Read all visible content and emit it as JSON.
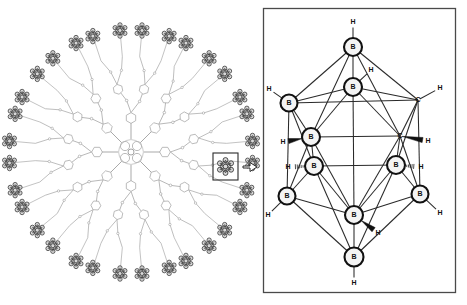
{
  "figure": {
    "background_color": "#ffffff",
    "ink_color": "#1a1a1a",
    "dendrimer_line_color": "#9a9a9a",
    "cluster_fill": "#f2f2f2"
  },
  "left_panel": {
    "name": "dendrimer-diagram",
    "description": "Radial porphyrin-cored dendrimer with peripheral carborane clusters",
    "core_label": "porphyrin-core",
    "branch_generations": 3,
    "peripheral_cluster_count": 32,
    "wedge_count": 8
  },
  "callout": {
    "name": "magnification-callout",
    "box_label": "selected-cluster",
    "arrow_glyph": "⇒"
  },
  "right_panel": {
    "name": "carborane-structure-panel",
    "border_color": "#4a4a4a",
    "molecule": "ortho-carborane C2B10H12",
    "atoms": [
      {
        "id": "a1",
        "element": "B",
        "x": 353,
        "y": 47,
        "r": 9.0,
        "h": {
          "label": "H",
          "x": 353,
          "y": 22,
          "style": "line",
          "angle": "up"
        }
      },
      {
        "id": "a2",
        "element": "B",
        "x": 353,
        "y": 87,
        "r": 9.0,
        "h": {
          "label": "H",
          "x": 371,
          "y": 70,
          "style": "line",
          "angle": "upright"
        }
      },
      {
        "id": "a3",
        "element": "B",
        "x": 289,
        "y": 103,
        "r": 8.5,
        "h": {
          "label": "H",
          "x": 269,
          "y": 89,
          "style": "line",
          "angle": "upleft"
        }
      },
      {
        "id": "a4",
        "element": "C",
        "x": 418,
        "y": 100,
        "r": 0.0,
        "h": {
          "label": "H",
          "x": 440,
          "y": 88,
          "style": "line",
          "angle": "upright"
        }
      },
      {
        "id": "a5",
        "element": "B",
        "x": 311,
        "y": 137,
        "r": 9.0,
        "h": {
          "label": "H",
          "x": 283,
          "y": 142,
          "style": "wedge",
          "angle": "left"
        }
      },
      {
        "id": "a6",
        "element": "C",
        "x": 400,
        "y": 136,
        "r": 0.0,
        "h": {
          "label": "H",
          "x": 428,
          "y": 141,
          "style": "wedge",
          "angle": "right"
        }
      },
      {
        "id": "a7",
        "element": "B",
        "x": 314,
        "y": 166,
        "r": 9.0,
        "h": {
          "label": "H",
          "x": 288,
          "y": 167,
          "style": "hash",
          "angle": "left"
        }
      },
      {
        "id": "a8",
        "element": "B",
        "x": 396,
        "y": 165,
        "r": 9.0,
        "h": {
          "label": "H",
          "x": 421,
          "y": 167,
          "style": "hash",
          "angle": "right"
        }
      },
      {
        "id": "a9",
        "element": "B",
        "x": 287,
        "y": 196,
        "r": 8.5,
        "h": {
          "label": "H",
          "x": 268,
          "y": 215,
          "style": "line",
          "angle": "downleft"
        }
      },
      {
        "id": "a10",
        "element": "B",
        "x": 420,
        "y": 194,
        "r": 8.5,
        "h": {
          "label": "H",
          "x": 440,
          "y": 213,
          "style": "line",
          "angle": "downright"
        }
      },
      {
        "id": "a11",
        "element": "B",
        "x": 354,
        "y": 215,
        "r": 9.0,
        "h": {
          "label": "H",
          "x": 378,
          "y": 233,
          "style": "wedge",
          "angle": "downright"
        }
      },
      {
        "id": "a12",
        "element": "B",
        "x": 354,
        "y": 257,
        "r": 9.5,
        "h": {
          "label": "H",
          "x": 354,
          "y": 283,
          "style": "line",
          "angle": "down"
        }
      }
    ],
    "bonds": [
      [
        "a1",
        "a2"
      ],
      [
        "a1",
        "a3"
      ],
      [
        "a1",
        "a4"
      ],
      [
        "a1",
        "a5"
      ],
      [
        "a1",
        "a6"
      ],
      [
        "a2",
        "a3"
      ],
      [
        "a2",
        "a4"
      ],
      [
        "a2",
        "a5"
      ],
      [
        "a2",
        "a6"
      ],
      [
        "a3",
        "a5"
      ],
      [
        "a3",
        "a7"
      ],
      [
        "a3",
        "a9"
      ],
      [
        "a4",
        "a6"
      ],
      [
        "a4",
        "a8"
      ],
      [
        "a4",
        "a10"
      ],
      [
        "a5",
        "a6"
      ],
      [
        "a5",
        "a7"
      ],
      [
        "a5",
        "a9"
      ],
      [
        "a5",
        "a11"
      ],
      [
        "a6",
        "a8"
      ],
      [
        "a6",
        "a10"
      ],
      [
        "a6",
        "a11"
      ],
      [
        "a7",
        "a8"
      ],
      [
        "a7",
        "a9"
      ],
      [
        "a7",
        "a11"
      ],
      [
        "a8",
        "a10"
      ],
      [
        "a8",
        "a11"
      ],
      [
        "a9",
        "a11"
      ],
      [
        "a9",
        "a12"
      ],
      [
        "a10",
        "a11"
      ],
      [
        "a10",
        "a12"
      ],
      [
        "a11",
        "a12"
      ],
      [
        "a3",
        "a4"
      ],
      [
        "a7",
        "a12"
      ],
      [
        "a8",
        "a12"
      ],
      [
        "a2",
        "a11"
      ]
    ]
  }
}
